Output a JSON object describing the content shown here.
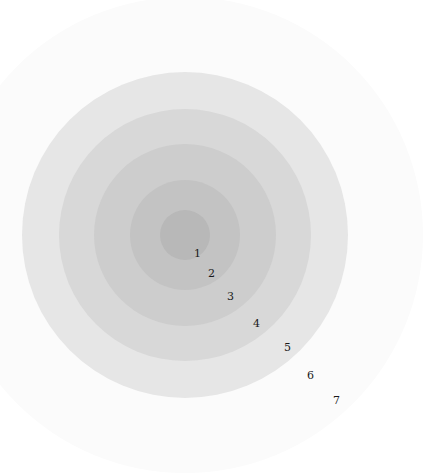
{
  "diagram": {
    "type": "concentric-rings",
    "center": [
      185,
      235
    ],
    "rings": [
      {
        "level": 7,
        "radius": 238,
        "color": "#fbfbfb"
      },
      {
        "level": 6,
        "radius": 163,
        "color": "#e6e6e6"
      },
      {
        "level": 5,
        "radius": 126,
        "color": "#d8d8d8"
      },
      {
        "level": 4,
        "radius": 91,
        "color": "#cdcdcd"
      },
      {
        "level": 3,
        "radius": 55,
        "color": "#c3c3c3"
      },
      {
        "level": 2,
        "radius": 25,
        "color": "#b8b8b8"
      }
    ],
    "labels": [
      {
        "text": "1",
        "x": 194,
        "y": 248
      },
      {
        "text": "2",
        "x": 208,
        "y": 268
      },
      {
        "text": "3",
        "x": 227,
        "y": 291
      },
      {
        "text": "4",
        "x": 253,
        "y": 318
      },
      {
        "text": "5",
        "x": 284,
        "y": 342
      },
      {
        "text": "6",
        "x": 307,
        "y": 370
      },
      {
        "text": "7",
        "x": 333,
        "y": 395
      }
    ]
  }
}
